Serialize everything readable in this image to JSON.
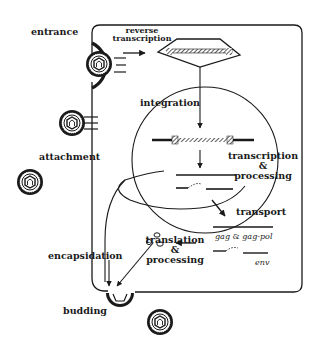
{
  "diagram": {
    "colors": {
      "ink": "#1a1a1a",
      "background": "#ffffff"
    },
    "steps": {
      "entrance": "entrance",
      "reverse_transcription": [
        "reverse",
        "transcription"
      ],
      "integration": "integration",
      "attachment": "attachment",
      "transcription_processing": [
        "transcription",
        "&",
        "processing"
      ],
      "transport": "transport",
      "encapsidation": "encapsidation",
      "translation_processing": [
        "translation",
        "&",
        "processing"
      ],
      "budding": "budding"
    },
    "transcripts": {
      "gag_label": "gag",
      "amp": "&",
      "gagpol_label": "gag-pol",
      "env_label": "env"
    }
  }
}
